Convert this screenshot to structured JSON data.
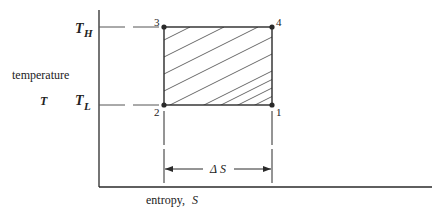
{
  "diagram": {
    "y_axis": {
      "label": "temperature",
      "symbol": "T"
    },
    "x_axis": {
      "label": "entropy,",
      "symbol": "S"
    },
    "levels": {
      "high": {
        "symbol": "T",
        "subscript": "H"
      },
      "low": {
        "symbol": "T",
        "subscript": "L"
      }
    },
    "points": [
      {
        "id": "1",
        "label": "1",
        "position": "bottom-right"
      },
      {
        "id": "2",
        "label": "2",
        "position": "bottom-left"
      },
      {
        "id": "3",
        "label": "3",
        "position": "top-left"
      },
      {
        "id": "4",
        "label": "4",
        "position": "top-right"
      }
    ],
    "dimension": {
      "label": "Δ S"
    },
    "region": {
      "fill": "hatched",
      "meaning": "net work / heat area"
    },
    "colors": {
      "line": "#2a2a2a",
      "hatch": "#444444",
      "dash": "#555555",
      "background": "#ffffff"
    }
  }
}
